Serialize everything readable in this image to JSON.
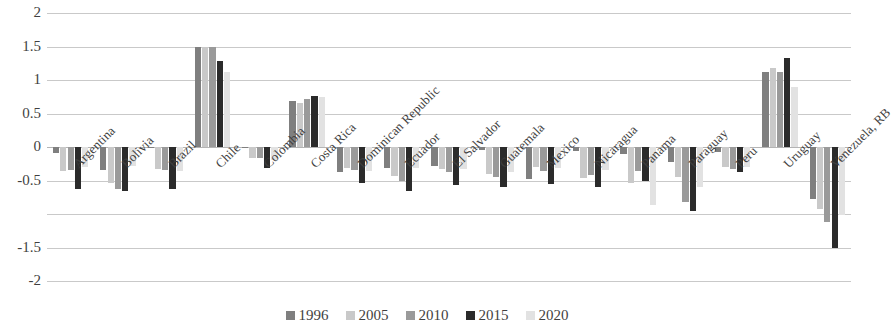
{
  "chart_data": {
    "type": "bar",
    "title": "",
    "subtitle": "",
    "xlabel": "",
    "ylabel": "",
    "ylim": [
      -2,
      2
    ],
    "ytick_labels": [
      "2",
      "1.5",
      "1",
      "0.5",
      "0",
      "-0.5",
      "-1",
      "-1.5",
      "-2"
    ],
    "ytick_values": [
      2,
      1.5,
      1,
      0.5,
      0,
      -0.5,
      -1,
      -1.5,
      -2
    ],
    "ytick_visible": [
      true,
      true,
      true,
      true,
      true,
      true,
      false,
      true,
      true
    ],
    "grid": true,
    "grid_axis": "y",
    "legend_position": "bottom",
    "categories": [
      "Argentina",
      "Bolivia",
      "Brazil",
      "Chile",
      "Colombia",
      "Costa Rica",
      "Dominican Republic",
      "Ecuador",
      "El Salvador",
      "Guatemala",
      "Mexico",
      "Nicaragua",
      "Panama",
      "Paraguay",
      "Peru",
      "Uruguay",
      "Venezuela, RB"
    ],
    "series": [
      {
        "name": "1996",
        "color": "#7f7f7f",
        "values": [
          -0.09,
          -0.34,
          -0.02,
          1.5,
          -0.02,
          0.68,
          -0.37,
          -0.31,
          -0.29,
          -0.05,
          -0.48,
          -0.06,
          -0.1,
          -0.22,
          -0.08,
          1.12,
          -0.77
        ]
      },
      {
        "name": "2005",
        "color": "#c9c9c9",
        "values": [
          -0.36,
          -0.53,
          -0.33,
          1.49,
          -0.16,
          0.65,
          -0.32,
          -0.44,
          -0.33,
          -0.4,
          -0.3,
          -0.46,
          -0.54,
          -0.45,
          -0.3,
          1.18,
          -0.93
        ]
      },
      {
        "name": "2010",
        "color": "#9a9a9a",
        "values": [
          -0.35,
          -0.62,
          -0.34,
          1.49,
          -0.17,
          0.72,
          -0.35,
          -0.5,
          -0.37,
          -0.45,
          -0.36,
          -0.42,
          -0.36,
          -0.82,
          -0.33,
          1.12,
          -1.12
        ]
      },
      {
        "name": "2015",
        "color": "#2b2b2b",
        "values": [
          -0.62,
          -0.65,
          -0.62,
          1.28,
          -0.31,
          0.76,
          -0.54,
          -0.66,
          -0.57,
          -0.6,
          -0.55,
          -0.6,
          -0.5,
          -0.95,
          -0.37,
          1.33,
          -1.5
        ]
      },
      {
        "name": "2020",
        "color": "#e2e2e2",
        "values": [
          -0.3,
          -0.28,
          -0.36,
          1.12,
          -0.2,
          0.74,
          -0.36,
          -0.31,
          -0.33,
          -0.38,
          -0.31,
          -0.35,
          -0.87,
          -0.6,
          -0.3,
          0.9,
          -1.02
        ]
      }
    ]
  },
  "legend": {
    "items": [
      {
        "label": "1996"
      },
      {
        "label": "2005"
      },
      {
        "label": "2010"
      },
      {
        "label": "2015"
      },
      {
        "label": "2020"
      }
    ]
  }
}
